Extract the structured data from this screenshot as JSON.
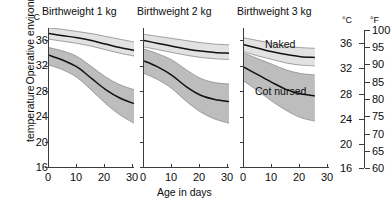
{
  "axes": {
    "y_label_line1": "Operative environmental",
    "y_label_line2": "temperature",
    "y_unit_left": "°C",
    "x_label": "Age in days",
    "y_ticks": [
      "36",
      "32",
      "28",
      "24",
      "20",
      "16"
    ],
    "x_ticks": [
      "0",
      "10",
      "20",
      "30"
    ],
    "y_min": 16,
    "y_max": 36,
    "x_min": 0,
    "x_max": 30
  },
  "right_axis": {
    "unit_c": "°C",
    "unit_f": "°F",
    "c_ticks": [
      "36",
      "32",
      "28",
      "24",
      "20",
      "16"
    ],
    "f_ticks": [
      "100",
      "95",
      "90",
      "85",
      "80",
      "75",
      "70",
      "65",
      "60"
    ],
    "f_min": 60,
    "f_max": 100
  },
  "series_labels": {
    "naked": "Naked",
    "cot_nursed": "Cot nursed"
  },
  "colors": {
    "axis": "#3a3a3a",
    "curve": "#111111",
    "band_naked": "#e2e2e2",
    "band_cot": "#bdbdbd",
    "band_edge": "#8a8a8a",
    "text": "#0c0c0c"
  },
  "panels": [
    {
      "title": "Birthweight 1 kg",
      "x_end": 30
    },
    {
      "title": "Birthweight 2 kg",
      "x_end": 30
    },
    {
      "title": "Birthweight 3 kg",
      "x_end": 25
    }
  ],
  "chart_data": {
    "type": "area",
    "xlabel": "Age in days",
    "ylabel": "Operative environmental temperature",
    "xlim": [
      0,
      30
    ],
    "ylim": [
      16,
      36
    ],
    "y_unit_primary": "°C",
    "y_unit_secondary": "°F",
    "grid": false,
    "legend": "inline annotations on third panel",
    "x": [
      0,
      5,
      10,
      15,
      20,
      25,
      30
    ],
    "panels": [
      {
        "name": "Birthweight 1 kg",
        "series": [
          {
            "name": "Naked",
            "mean": [
              35.2,
              34.9,
              34.6,
              34.2,
              33.7,
              33.2,
              32.8
            ],
            "upper": [
              36.0,
              35.8,
              35.5,
              35.2,
              34.8,
              34.4,
              34.0
            ],
            "lower": [
              34.4,
              34.1,
              33.8,
              33.4,
              32.9,
              32.4,
              32.0
            ]
          },
          {
            "name": "Cot nursed",
            "mean": [
              32.1,
              31.4,
              30.4,
              28.8,
              27.2,
              26.0,
              25.2
            ],
            "upper": [
              33.2,
              32.7,
              31.9,
              30.5,
              29.0,
              27.9,
              27.2
            ],
            "lower": [
              30.7,
              30.0,
              28.9,
              27.1,
              25.2,
              23.6,
              22.4
            ]
          }
        ]
      },
      {
        "name": "Birthweight 2 kg",
        "series": [
          {
            "name": "Naked",
            "mean": [
              34.2,
              33.8,
              33.4,
              33.0,
              32.7,
              32.5,
              32.4
            ],
            "upper": [
              35.1,
              34.8,
              34.5,
              34.2,
              33.9,
              33.7,
              33.6
            ],
            "lower": [
              33.3,
              32.9,
              32.5,
              32.1,
              31.8,
              31.6,
              31.5
            ]
          },
          {
            "name": "Cot nursed",
            "mean": [
              31.3,
              30.4,
              29.2,
              27.6,
              26.4,
              25.8,
              25.5
            ],
            "upper": [
              33.0,
              32.3,
              31.4,
              30.0,
              28.8,
              28.2,
              28.0
            ],
            "lower": [
              29.5,
              28.6,
              27.3,
              25.5,
              24.0,
              23.0,
              22.4
            ]
          }
        ]
      },
      {
        "name": "Birthweight 3 kg",
        "series": [
          {
            "name": "Naked",
            "mean": [
              33.6,
              33.1,
              32.6,
              32.2,
              31.9,
              31.8
            ],
            "upper": [
              34.6,
              34.2,
              33.8,
              33.4,
              33.2,
              33.1
            ],
            "lower": [
              32.6,
              32.0,
              31.5,
              31.0,
              30.7,
              30.6
            ]
          },
          {
            "name": "Cot nursed",
            "mean": [
              30.4,
              29.3,
              28.2,
              27.2,
              26.6,
              26.3
            ],
            "upper": [
              32.4,
              31.6,
              30.8,
              30.0,
              29.5,
              29.3
            ],
            "lower": [
              28.4,
              27.0,
              25.5,
              24.2,
              23.2,
              22.7
            ]
          }
        ],
        "x": [
          0,
          5,
          10,
          15,
          20,
          25
        ]
      }
    ]
  }
}
